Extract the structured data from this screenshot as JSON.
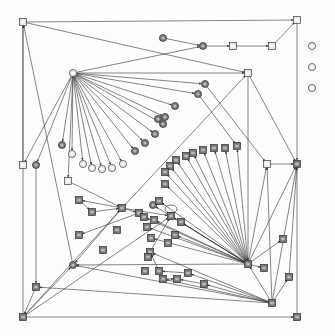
{
  "diagram": {
    "type": "directed-graph",
    "width": 335,
    "height": 336,
    "colors": {
      "edge": "#333333",
      "node_fill_dark": "#777777",
      "node_fill_light": "#e8e8e8",
      "node_stroke": "#222222",
      "background": "#fdfdfd"
    },
    "note": "Node labels are too small to read in the screenshot; nodes are recorded by position and shape only.",
    "nodes": [
      {
        "id": "n1",
        "shape": "square",
        "x": 23,
        "y": 22,
        "fill": "light"
      },
      {
        "id": "n2",
        "shape": "square",
        "x": 297,
        "y": 20,
        "fill": "light"
      },
      {
        "id": "n3",
        "shape": "circle",
        "x": 163,
        "y": 38,
        "fill": "dark"
      },
      {
        "id": "n4",
        "shape": "circle",
        "x": 203,
        "y": 46,
        "fill": "dark"
      },
      {
        "id": "n5",
        "shape": "square",
        "x": 233,
        "y": 46,
        "fill": "light"
      },
      {
        "id": "n6",
        "shape": "square",
        "x": 272,
        "y": 46,
        "fill": "light"
      },
      {
        "id": "n7",
        "shape": "circle",
        "x": 312,
        "y": 46,
        "fill": "light"
      },
      {
        "id": "n8",
        "shape": "circle",
        "x": 312,
        "y": 67,
        "fill": "light"
      },
      {
        "id": "n9",
        "shape": "circle",
        "x": 312,
        "y": 88,
        "fill": "light"
      },
      {
        "id": "n10",
        "shape": "square",
        "x": 248,
        "y": 73,
        "fill": "light"
      },
      {
        "id": "n11",
        "shape": "circle",
        "x": 73,
        "y": 73,
        "fill": "light"
      },
      {
        "id": "n12",
        "shape": "circle",
        "x": 205,
        "y": 84,
        "fill": "dark"
      },
      {
        "id": "n13",
        "shape": "circle",
        "x": 198,
        "y": 94,
        "fill": "dark"
      },
      {
        "id": "n14",
        "shape": "circle",
        "x": 175,
        "y": 106,
        "fill": "dark"
      },
      {
        "id": "n15",
        "shape": "circle",
        "x": 165,
        "y": 117,
        "fill": "dark"
      },
      {
        "id": "n16",
        "shape": "circle",
        "x": 158,
        "y": 119,
        "fill": "dark"
      },
      {
        "id": "n17",
        "shape": "circle",
        "x": 163,
        "y": 124,
        "fill": "dark"
      },
      {
        "id": "n18",
        "shape": "circle",
        "x": 155,
        "y": 134,
        "fill": "dark"
      },
      {
        "id": "n19",
        "shape": "circle",
        "x": 145,
        "y": 143,
        "fill": "dark"
      },
      {
        "id": "n20",
        "shape": "circle",
        "x": 135,
        "y": 151,
        "fill": "dark"
      },
      {
        "id": "n21",
        "shape": "circle",
        "x": 62,
        "y": 145,
        "fill": "dark"
      },
      {
        "id": "n22",
        "shape": "circle",
        "x": 72,
        "y": 154,
        "fill": "light"
      },
      {
        "id": "n23",
        "shape": "circle",
        "x": 83,
        "y": 164,
        "fill": "light"
      },
      {
        "id": "n24",
        "shape": "circle",
        "x": 92,
        "y": 168,
        "fill": "light"
      },
      {
        "id": "n25",
        "shape": "circle",
        "x": 102,
        "y": 169,
        "fill": "light"
      },
      {
        "id": "n26",
        "shape": "circle",
        "x": 112,
        "y": 168,
        "fill": "light"
      },
      {
        "id": "n27",
        "shape": "circle",
        "x": 123,
        "y": 164,
        "fill": "light"
      },
      {
        "id": "n28",
        "shape": "square",
        "x": 23,
        "y": 165,
        "fill": "light"
      },
      {
        "id": "n29",
        "shape": "circle",
        "x": 36,
        "y": 165,
        "fill": "dark"
      },
      {
        "id": "n30",
        "shape": "square",
        "x": 267,
        "y": 164,
        "fill": "light"
      },
      {
        "id": "n31",
        "shape": "square",
        "x": 297,
        "y": 164,
        "fill": "dark"
      },
      {
        "id": "n32",
        "shape": "square",
        "x": 237,
        "y": 146,
        "fill": "dark"
      },
      {
        "id": "n33",
        "shape": "square",
        "x": 225,
        "y": 148,
        "fill": "dark"
      },
      {
        "id": "n34",
        "shape": "square",
        "x": 214,
        "y": 148,
        "fill": "dark"
      },
      {
        "id": "n35",
        "shape": "square",
        "x": 203,
        "y": 150,
        "fill": "dark"
      },
      {
        "id": "n36",
        "shape": "square",
        "x": 193,
        "y": 153,
        "fill": "dark"
      },
      {
        "id": "n37",
        "shape": "square",
        "x": 186,
        "y": 156,
        "fill": "dark"
      },
      {
        "id": "n38",
        "shape": "square",
        "x": 176,
        "y": 160,
        "fill": "dark"
      },
      {
        "id": "n39",
        "shape": "square",
        "x": 170,
        "y": 166,
        "fill": "dark"
      },
      {
        "id": "n40",
        "shape": "square",
        "x": 165,
        "y": 172,
        "fill": "dark"
      },
      {
        "id": "n41",
        "shape": "square",
        "x": 68,
        "y": 181,
        "fill": "light"
      },
      {
        "id": "n42",
        "shape": "square",
        "x": 165,
        "y": 184,
        "fill": "dark"
      },
      {
        "id": "n43",
        "shape": "square",
        "x": 79,
        "y": 200,
        "fill": "dark"
      },
      {
        "id": "n44",
        "shape": "square",
        "x": 92,
        "y": 212,
        "fill": "dark"
      },
      {
        "id": "n45",
        "shape": "square",
        "x": 122,
        "y": 208,
        "fill": "dark"
      },
      {
        "id": "n46",
        "shape": "circle",
        "x": 153,
        "y": 205,
        "fill": "dark"
      },
      {
        "id": "n47",
        "shape": "square",
        "x": 139,
        "y": 213,
        "fill": "dark"
      },
      {
        "id": "n48",
        "shape": "square",
        "x": 159,
        "y": 201,
        "fill": "dark"
      },
      {
        "id": "n49",
        "shape": "square",
        "x": 144,
        "y": 217,
        "fill": "dark"
      },
      {
        "id": "n50",
        "shape": "square",
        "x": 154,
        "y": 220,
        "fill": "dark"
      },
      {
        "id": "n51",
        "shape": "square",
        "x": 79,
        "y": 235,
        "fill": "dark"
      },
      {
        "id": "n52",
        "shape": "square",
        "x": 171,
        "y": 216,
        "fill": "dark"
      },
      {
        "id": "n53",
        "shape": "square",
        "x": 181,
        "y": 222,
        "fill": "dark"
      },
      {
        "id": "n54",
        "shape": "square",
        "x": 117,
        "y": 230,
        "fill": "dark"
      },
      {
        "id": "n55",
        "shape": "square",
        "x": 147,
        "y": 227,
        "fill": "dark"
      },
      {
        "id": "n56",
        "shape": "square",
        "x": 151,
        "y": 238,
        "fill": "dark"
      },
      {
        "id": "n57",
        "shape": "square",
        "x": 175,
        "y": 235,
        "fill": "dark"
      },
      {
        "id": "n58",
        "shape": "square",
        "x": 168,
        "y": 243,
        "fill": "dark"
      },
      {
        "id": "n59",
        "shape": "square",
        "x": 103,
        "y": 250,
        "fill": "dark"
      },
      {
        "id": "n60",
        "shape": "square",
        "x": 283,
        "y": 239,
        "fill": "dark"
      },
      {
        "id": "n61",
        "shape": "circle",
        "x": 73,
        "y": 265,
        "fill": "dark"
      },
      {
        "id": "n62",
        "shape": "square",
        "x": 150,
        "y": 252,
        "fill": "dark"
      },
      {
        "id": "n63",
        "shape": "square",
        "x": 148,
        "y": 257,
        "fill": "dark"
      },
      {
        "id": "n64",
        "shape": "square",
        "x": 248,
        "y": 264,
        "fill": "dark"
      },
      {
        "id": "n65",
        "shape": "square",
        "x": 264,
        "y": 268,
        "fill": "dark"
      },
      {
        "id": "n66",
        "shape": "square",
        "x": 289,
        "y": 277,
        "fill": "dark"
      },
      {
        "id": "n67",
        "shape": "square",
        "x": 36,
        "y": 287,
        "fill": "dark"
      },
      {
        "id": "n68",
        "shape": "square",
        "x": 145,
        "y": 271,
        "fill": "dark"
      },
      {
        "id": "n69",
        "shape": "square",
        "x": 159,
        "y": 271,
        "fill": "dark"
      },
      {
        "id": "n70",
        "shape": "square",
        "x": 188,
        "y": 273,
        "fill": "dark"
      },
      {
        "id": "n71",
        "shape": "square",
        "x": 163,
        "y": 279,
        "fill": "dark"
      },
      {
        "id": "n72",
        "shape": "square",
        "x": 177,
        "y": 279,
        "fill": "dark"
      },
      {
        "id": "n73",
        "shape": "square",
        "x": 204,
        "y": 284,
        "fill": "dark"
      },
      {
        "id": "n74",
        "shape": "square",
        "x": 272,
        "y": 303,
        "fill": "dark"
      },
      {
        "id": "n75",
        "shape": "square",
        "x": 23,
        "y": 317,
        "fill": "dark"
      },
      {
        "id": "n76",
        "shape": "square",
        "x": 297,
        "y": 317,
        "fill": "dark"
      }
    ],
    "edges": [
      [
        "n1",
        "n2"
      ],
      [
        "n1",
        "n10"
      ],
      [
        "n3",
        "n4"
      ],
      [
        "n4",
        "n5"
      ],
      [
        "n5",
        "n6"
      ],
      [
        "n6",
        "n2"
      ],
      [
        "n2",
        "n31"
      ],
      [
        "n11",
        "n4"
      ],
      [
        "n11",
        "n10"
      ],
      [
        "n11",
        "n12"
      ],
      [
        "n11",
        "n13"
      ],
      [
        "n11",
        "n14"
      ],
      [
        "n11",
        "n15"
      ],
      [
        "n11",
        "n17"
      ],
      [
        "n11",
        "n18"
      ],
      [
        "n11",
        "n19"
      ],
      [
        "n11",
        "n20"
      ],
      [
        "n11",
        "n21"
      ],
      [
        "n11",
        "n22"
      ],
      [
        "n11",
        "n23"
      ],
      [
        "n11",
        "n24"
      ],
      [
        "n11",
        "n25"
      ],
      [
        "n11",
        "n26"
      ],
      [
        "n11",
        "n27"
      ],
      [
        "n11",
        "n28"
      ],
      [
        "n11",
        "n29"
      ],
      [
        "n11",
        "n41"
      ],
      [
        "n10",
        "n31"
      ],
      [
        "n12",
        "n30"
      ],
      [
        "n13",
        "n32"
      ],
      [
        "n30",
        "n31"
      ],
      [
        "n28",
        "n1"
      ],
      [
        "n75",
        "n1"
      ],
      [
        "n61",
        "n1"
      ],
      [
        "n29",
        "n67"
      ],
      [
        "n67",
        "n75"
      ],
      [
        "n41",
        "n45"
      ],
      [
        "n45",
        "n43"
      ],
      [
        "n43",
        "n44"
      ],
      [
        "n44",
        "n45"
      ],
      [
        "n45",
        "n47"
      ],
      [
        "n47",
        "n51"
      ],
      [
        "n45",
        "n52"
      ],
      [
        "n45",
        "n61"
      ],
      [
        "n75",
        "n61"
      ],
      [
        "n75",
        "n45"
      ],
      [
        "n75",
        "n52"
      ],
      [
        "n45",
        "n10"
      ],
      [
        "n10",
        "n64"
      ],
      [
        "n64",
        "n32"
      ],
      [
        "n64",
        "n33"
      ],
      [
        "n64",
        "n34"
      ],
      [
        "n64",
        "n35"
      ],
      [
        "n64",
        "n36"
      ],
      [
        "n64",
        "n37"
      ],
      [
        "n64",
        "n38"
      ],
      [
        "n64",
        "n39"
      ],
      [
        "n64",
        "n40"
      ],
      [
        "n64",
        "n42"
      ],
      [
        "n64",
        "n48"
      ],
      [
        "n64",
        "n46"
      ],
      [
        "n64",
        "n49"
      ],
      [
        "n64",
        "n50"
      ],
      [
        "n64",
        "n53"
      ],
      [
        "n64",
        "n55"
      ],
      [
        "n64",
        "n56"
      ],
      [
        "n64",
        "n57"
      ],
      [
        "n64",
        "n52"
      ],
      [
        "n64",
        "n61"
      ],
      [
        "n64",
        "n30"
      ],
      [
        "n64",
        "n31"
      ],
      [
        "n64",
        "n60"
      ],
      [
        "n64",
        "n65"
      ],
      [
        "n74",
        "n64"
      ],
      [
        "n74",
        "n30"
      ],
      [
        "n74",
        "n31"
      ],
      [
        "n74",
        "n66"
      ],
      [
        "n66",
        "n31"
      ],
      [
        "n74",
        "n61"
      ],
      [
        "n74",
        "n67"
      ],
      [
        "n74",
        "n62"
      ],
      [
        "n74",
        "n70"
      ],
      [
        "n74",
        "n73"
      ],
      [
        "n74",
        "n71"
      ],
      [
        "n62",
        "n52"
      ],
      [
        "n69",
        "n62"
      ],
      [
        "n71",
        "n72"
      ],
      [
        "n70",
        "n69"
      ],
      [
        "n73",
        "n72"
      ],
      [
        "n75",
        "n76"
      ],
      [
        "n76",
        "n31"
      ],
      [
        "n52",
        "n52"
      ]
    ]
  }
}
